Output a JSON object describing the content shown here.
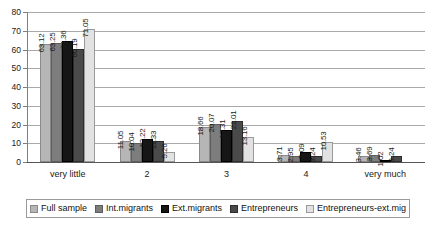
{
  "chart_data": {
    "type": "bar",
    "title": "",
    "xlabel": "",
    "ylabel": "",
    "ylim": [
      0,
      80
    ],
    "ytick_step": 10,
    "yticks": [
      "0",
      "10",
      "20",
      "30",
      "40",
      "50",
      "60",
      "70",
      "80"
    ],
    "grid": true,
    "legend_position": "bottom",
    "categories": [
      "very little",
      "2",
      "3",
      "4",
      "very much"
    ],
    "series": [
      {
        "name": "Full sample",
        "color": "#b6b6b6",
        "values": [
          63.12,
          11.05,
          18.66,
          3.71,
          3.46
        ],
        "labels": [
          "63.12",
          "11.05",
          "18.66",
          "3.71",
          "3.46"
        ]
      },
      {
        "name": "Int.migrants",
        "color": "#7d7d7d",
        "values": [
          63.25,
          10.04,
          20.07,
          2.95,
          3.69
        ],
        "labels": [
          "63.25",
          "10.04",
          "20.07",
          "2.95",
          "3.69"
        ]
      },
      {
        "name": "Ext.migrants",
        "color": "#161616",
        "values": [
          64.36,
          12.22,
          17.31,
          5.09,
          1.02
        ],
        "labels": [
          "64.36",
          "12.22",
          "17.31",
          "5.09",
          "1.02"
        ]
      },
      {
        "name": "Entrepreneurs",
        "color": "#4a4a4a",
        "values": [
          60.19,
          11.33,
          22.01,
          3.24,
          3.24
        ],
        "labels": [
          "60.19",
          "11.33",
          "22.01",
          "3.24",
          "3.24"
        ]
      },
      {
        "name": "Entrepreneurs-ext.mig",
        "color": "#e2e2e2",
        "values": [
          71.05,
          5.26,
          13.16,
          10.53,
          0
        ],
        "labels": [
          "71.05",
          "5.26",
          "13.16",
          "10.53",
          ""
        ]
      }
    ]
  }
}
